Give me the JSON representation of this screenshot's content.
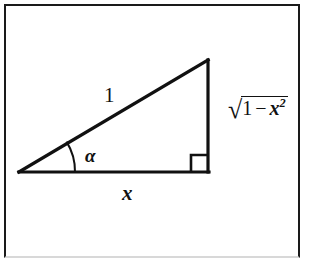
{
  "figure": {
    "kind": "right-triangle-diagram",
    "border_color": "#1a1a1a",
    "stroke_color": "#111111",
    "background_color": "#ffffff",
    "labels": {
      "hypotenuse": "1",
      "base": "x",
      "angle": "α",
      "vertical_radical_symbol": "√",
      "vertical_radicand_first": "1",
      "vertical_radicand_operator": "−",
      "vertical_radicand_variable": "x",
      "vertical_radicand_exponent": "2"
    },
    "geometry": {
      "left_vertex": [
        19,
        172
      ],
      "right_angle_vertex": [
        208,
        172
      ],
      "apex_vertex": [
        208,
        60
      ],
      "angle_arc_radius": 56,
      "right_angle_marker_size": 17,
      "line_width": 3
    }
  }
}
